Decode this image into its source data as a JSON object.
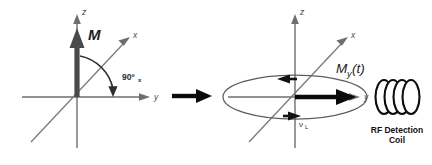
{
  "figure": {
    "background_color": "#ffffff",
    "width": 432,
    "height": 165
  },
  "panels": {
    "left": {
      "name": "equilibrium-magnetization",
      "axes": {
        "z_label": "z",
        "x_label": "x",
        "y_label": "y"
      },
      "vector_label": "M",
      "pulse_label": "90º",
      "pulse_sublabel": "x"
    },
    "right": {
      "name": "transverse-precessing-magnetization",
      "axes": {
        "z_label": "z",
        "x_label": "x",
        "y_label": "y"
      },
      "vector_label": "M",
      "vector_sublabel": "y",
      "vector_arg": "(t)",
      "precession_label": "ν",
      "precession_sublabel": "L",
      "coil_label_line1": "RF Detection",
      "coil_label_line2": "Coil",
      "coil_turns": 4
    }
  },
  "transition": {
    "name": "transition-arrow",
    "direction": "right"
  },
  "colors": {
    "axis": "#6e6e72",
    "magnetization_vector": "#4a4a4d",
    "transverse_vector": "#0b0b0b",
    "arc": "#2e2e30",
    "orbit": "#5d5d61",
    "coil": "#0d0d0d",
    "text": "#2b2b2d",
    "background": "#ffffff"
  }
}
